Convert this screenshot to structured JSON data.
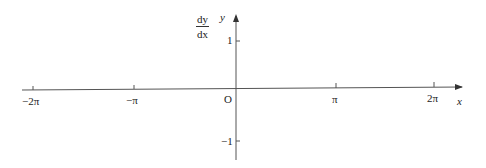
{
  "diagram": {
    "type": "coordinate-axes",
    "y_axis_label_fraction": {
      "numerator": "dy",
      "denominator": "dx"
    },
    "y_axis_name": "y",
    "x_axis_name": "x",
    "origin_label": "O",
    "x_ticks": [
      {
        "label": "−2π",
        "value": -6.283
      },
      {
        "label": "−π",
        "value": -3.1416
      },
      {
        "label": "π",
        "value": 3.1416
      },
      {
        "label": "2π",
        "value": 6.283
      }
    ],
    "y_ticks": [
      {
        "label": "1",
        "value": 1
      },
      {
        "label": "−1",
        "value": -1
      }
    ],
    "colors": {
      "axis": "#555555",
      "text": "#222222"
    }
  }
}
